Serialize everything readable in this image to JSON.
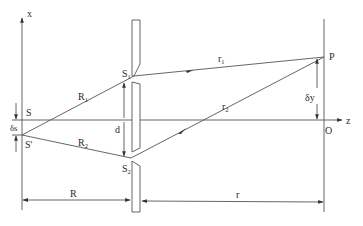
{
  "figure": {
    "type": "double-slit interference geometry",
    "labels": {
      "x_axis": "x",
      "z_axis": "z",
      "source": "S",
      "source_shifted": "S'",
      "source_shift": "δs",
      "slit1": "S",
      "slit1_sub": "1",
      "slit2": "S",
      "slit2_sub": "2",
      "path_R1": "R",
      "path_R1_sub": "1",
      "path_R2": "R",
      "path_R2_sub": "2",
      "path_r1": "r",
      "path_r1_sub": "1",
      "path_r2": "r",
      "path_r2_sub": "2",
      "slit_separation": "d",
      "point": "P",
      "origin": "O",
      "screen_offset": "δy",
      "source_distance": "R",
      "screen_distance": "r"
    },
    "colors": {
      "line": "#555555",
      "text": "#2a2a2a",
      "background": "#ffffff"
    }
  }
}
